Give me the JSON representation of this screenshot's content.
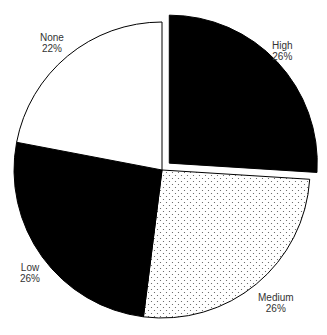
{
  "chart_data": {
    "type": "pie",
    "title": "",
    "start_angle_deg": 0,
    "direction": "clockwise",
    "categories": [
      "High",
      "Medium",
      "Low",
      "None"
    ],
    "values": [
      26,
      26,
      26,
      22
    ],
    "labels": [
      {
        "name": "High",
        "pct": "26%"
      },
      {
        "name": "Medium",
        "pct": "26%"
      },
      {
        "name": "Low",
        "pct": "26%"
      },
      {
        "name": "None",
        "pct": "22%"
      }
    ],
    "fills": [
      "solid-black",
      "dotted",
      "solid-black",
      "white"
    ],
    "exploded": [
      "High"
    ],
    "legend": "none"
  },
  "colors": {
    "black": "#000000",
    "white": "#ffffff",
    "stroke": "#000000",
    "dot": "#555555",
    "label": "#333333"
  }
}
